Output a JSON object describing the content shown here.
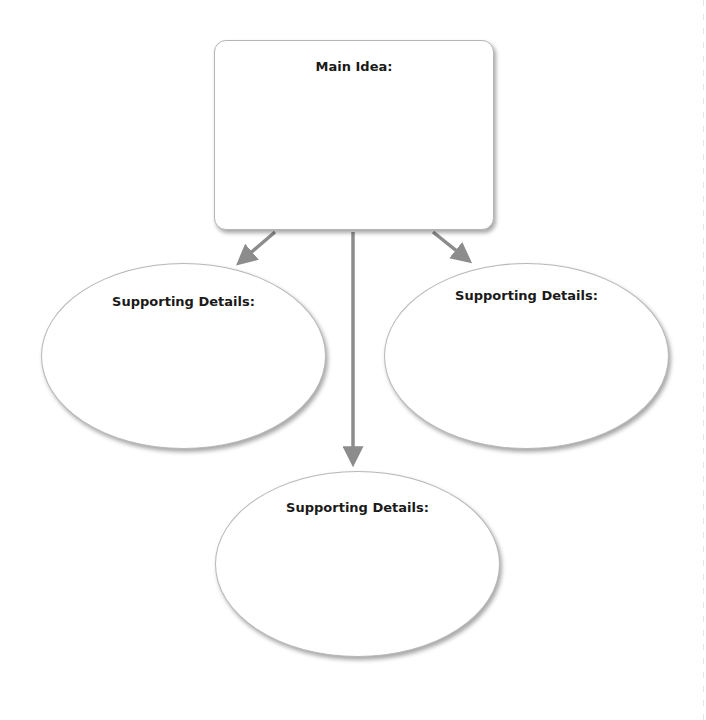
{
  "diagram": {
    "type": "main-idea-supporting-details organizer",
    "main_idea": {
      "label": "Main Idea:"
    },
    "supporting_details": [
      {
        "position": "left",
        "label": "Supporting Details:"
      },
      {
        "position": "right",
        "label": "Supporting Details:"
      },
      {
        "position": "bottom",
        "label": "Supporting Details:"
      }
    ],
    "arrows": [
      {
        "from": "main_idea",
        "to": "left"
      },
      {
        "from": "main_idea",
        "to": "bottom"
      },
      {
        "from": "main_idea",
        "to": "right"
      }
    ],
    "colors": {
      "arrow": "#8c8c8c",
      "border": "#b5b5b5",
      "text": "#1a1a1a"
    }
  }
}
